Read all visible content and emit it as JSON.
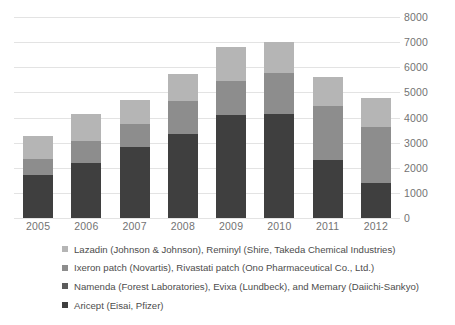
{
  "chart_data": {
    "type": "bar",
    "subtype": "stacked-bar",
    "title": "",
    "xlabel": "",
    "ylabel": "",
    "categories": [
      "2005",
      "2006",
      "2007",
      "2008",
      "2009",
      "2010",
      "2011",
      "2012"
    ],
    "ylim": [
      0,
      8000
    ],
    "ytick_values": [
      8000,
      7000,
      6000,
      5000,
      4000,
      3000,
      2000,
      1000,
      0
    ],
    "ytick_labels": [
      "8000",
      "7000",
      "6000",
      "5000",
      "4000",
      "3000",
      "2000",
      "1000",
      "0"
    ],
    "grid": true,
    "legend_position": "below",
    "stack_order_bottom_to_top": [
      "Aricept",
      "Namenda",
      "Ixeron",
      "Lazadin"
    ],
    "series": [
      {
        "name": "Lazadin (Johnson & Johnson), Reminyl (Shire, Takeda Chemical Industries)",
        "short_name": "Lazadin / Reminyl",
        "color": "#b5b5b5",
        "values": [
          915,
          1075,
          955,
          1075,
          1355,
          1235,
          1155,
          1155
        ]
      },
      {
        "name": "Ixeron patch (Novartis), Rivastati patch (Ono Pharmaceutical Co., Ltd.)",
        "short_name": "Ixeron / Rivastati patch",
        "color": "#8d8d8d",
        "values": [
          640,
          875,
          915,
          1315,
          1355,
          1634,
          2150,
          2230
        ]
      },
      {
        "name": "Namenda (Forest Laboratories), Evixa (Lundbeck), and Memary (Daiichi-Sankyo)",
        "short_name": "Namenda / Evixa / Memary",
        "color": "#5c5c5c",
        "values": [
          0,
          0,
          0,
          0,
          0,
          0,
          0,
          0
        ]
      },
      {
        "name": "Aricept (Eisai, Pfizer)",
        "short_name": "Aricept",
        "color": "#3f3f3f",
        "values": [
          1715,
          2190,
          2830,
          3345,
          4105,
          4143,
          2310,
          1395
        ]
      }
    ],
    "totals": [
      3270,
      4140,
      4700,
      5735,
      6815,
      7012,
      5615,
      4780
    ]
  },
  "axis": {
    "ticks": [
      {
        "label": "8000",
        "value": 8000
      },
      {
        "label": "7000",
        "value": 7000
      },
      {
        "label": "6000",
        "value": 6000
      },
      {
        "label": "5000",
        "value": 5000
      },
      {
        "label": "4000",
        "value": 4000
      },
      {
        "label": "3000",
        "value": 3000
      },
      {
        "label": "2000",
        "value": 2000
      },
      {
        "label": "1000",
        "value": 1000
      },
      {
        "label": "0",
        "value": 0
      }
    ]
  },
  "legend": {
    "items": [
      {
        "label": "Lazadin (Johnson & Johnson), Reminyl (Shire, Takeda Chemical Industries)",
        "color": "#b5b5b5"
      },
      {
        "label": "Ixeron patch (Novartis), Rivastati patch (Ono Pharmaceutical Co., Ltd.)",
        "color": "#8d8d8d"
      },
      {
        "label": "Namenda (Forest Laboratories), Evixa (Lundbeck), and Memary (Daiichi-Sankyo)",
        "color": "#5c5c5c"
      },
      {
        "label": "Aricept (Eisai, Pfizer)",
        "color": "#3f3f3f"
      }
    ]
  }
}
